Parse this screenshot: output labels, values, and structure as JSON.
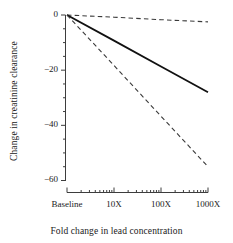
{
  "chart_data": {
    "type": "line",
    "title": "",
    "xlabel": "Fold change in lead concentration",
    "ylabel": "Change in creatinine clearance",
    "x_scale": "log",
    "x_categories": [
      "Baseline",
      "10X",
      "100X",
      "1000X"
    ],
    "x_major_values": [
      1,
      10,
      100,
      1000
    ],
    "xlim": [
      1,
      1000
    ],
    "ylim": [
      -62,
      2
    ],
    "y_ticks": [
      0,
      -20,
      -40,
      -60
    ],
    "y_tick_labels": [
      "0",
      "−20",
      "−40",
      "−60"
    ],
    "y_minor_step": 5,
    "grid": false,
    "legend": "none",
    "series": [
      {
        "name": "Upper confidence limit",
        "style": "dashed",
        "color": "#3a3a3a",
        "x": [
          1,
          10,
          100,
          1000
        ],
        "values": [
          0,
          -0.8,
          -1.7,
          -2.5
        ]
      },
      {
        "name": "Estimate",
        "style": "solid",
        "color": "#111111",
        "x": [
          1,
          10,
          100,
          1000
        ],
        "values": [
          0,
          -9.3,
          -18.7,
          -28.0
        ]
      },
      {
        "name": "Lower confidence limit",
        "style": "dashed",
        "color": "#3a3a3a",
        "x": [
          1,
          10,
          100,
          1000
        ],
        "values": [
          0,
          -18.3,
          -36.7,
          -55.0
        ]
      }
    ]
  },
  "axes": {
    "y_label_text": "Change in creatinine clearance",
    "x_label_text": "Fold change in lead concentration",
    "y_tick_0": "0",
    "y_tick_20": "−20",
    "y_tick_40": "−40",
    "y_tick_60": "−60",
    "x_tick_baseline": "Baseline",
    "x_tick_10": "10X",
    "x_tick_100": "100X",
    "x_tick_1000": "1000X"
  },
  "colors": {
    "axis": "#3d3d3d",
    "solid_line": "#111111",
    "dashed_line": "#3a3a3a",
    "text": "#1a1a1a",
    "background": "#ffffff"
  }
}
